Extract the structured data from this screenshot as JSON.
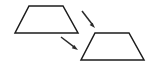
{
  "figure": {
    "background_color": "#ffffff",
    "stroke_color": "#1c1c1c",
    "arrow_color": "#2a2a2a",
    "stroke_width": 1.5,
    "width": 151,
    "height": 68
  },
  "shapes": [
    {
      "name": "source-trapezoid",
      "type": "trapezoid",
      "label": "",
      "points": "29,6 63,6 78,33 15,33",
      "vertices": [
        {
          "x": 29,
          "y": 6
        },
        {
          "x": 63,
          "y": 6
        },
        {
          "x": 78,
          "y": 33
        },
        {
          "x": 15,
          "y": 33
        }
      ]
    },
    {
      "name": "image-trapezoid",
      "type": "trapezoid",
      "label": "",
      "points": "95,33 129,33 144,60 81,60",
      "vertices": [
        {
          "x": 95,
          "y": 33
        },
        {
          "x": 129,
          "y": 33
        },
        {
          "x": 144,
          "y": 60
        },
        {
          "x": 81,
          "y": 60
        }
      ]
    }
  ],
  "arrows": [
    {
      "name": "upper-arrow",
      "direction": "down-right",
      "start": {
        "x": 82,
        "y": 11
      },
      "end": {
        "x": 95,
        "y": 28
      }
    },
    {
      "name": "lower-arrow",
      "direction": "down-right",
      "start": {
        "x": 61,
        "y": 37
      },
      "end": {
        "x": 78,
        "y": 50
      }
    }
  ]
}
